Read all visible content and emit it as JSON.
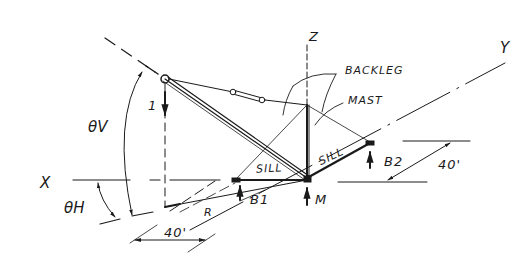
{
  "diagram": {
    "type": "derrick-geometry-sketch",
    "axes": {
      "x_label": "X",
      "y_label": "Y",
      "z_label": "Z"
    },
    "members": {
      "backleg_label": "BACKLEG",
      "mast_label": "MAST",
      "sill_left_label": "SILL",
      "sill_right_label": "SILL"
    },
    "supports": {
      "b1_label": "B1",
      "b2_label": "B2",
      "m_label": "M"
    },
    "load": {
      "label": "1"
    },
    "angles": {
      "vertical": "θV",
      "horizontal": "θH"
    },
    "dimensions": {
      "radius_label": "R",
      "left_sill_length": "40'",
      "right_sill_length": "40'"
    },
    "colors": {
      "ink": "#1a1a1a",
      "paper": "#ffffff"
    }
  }
}
